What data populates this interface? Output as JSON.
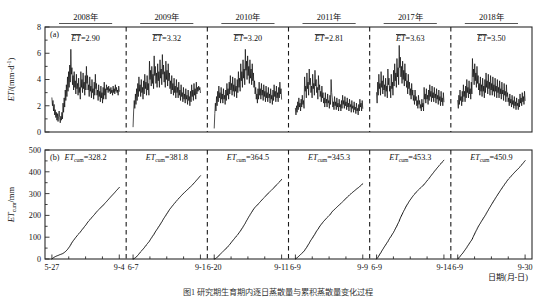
{
  "figure": {
    "caption": "图1  研究期生育期内逐日蒸散量与累积蒸散量变化过程",
    "xaxis_title": "日期(月-日)",
    "panel_a": {
      "id": "(a)",
      "ylabel_main": "ET",
      "ylabel_units": "/(mm·d",
      "ylabel_sup": "-1",
      "ylabel_tail": ")",
      "ylim": [
        0,
        8
      ],
      "yticks": [
        "0",
        "2",
        "4",
        "6",
        "8"
      ]
    },
    "panel_b": {
      "id": "(b)",
      "ylabel_main": "ET",
      "ylabel_sub": "cum",
      "ylabel_units": "/mm",
      "ylim": [
        0,
        500
      ],
      "yticks": [
        "0",
        "100",
        "200",
        "300",
        "400",
        "500"
      ]
    }
  },
  "chart_data": {
    "type": "line",
    "title": "图1  研究期生育期内逐日蒸散量与累积蒸散量变化过程",
    "xlabel": "日期(月-日)",
    "panels": [
      {
        "id": "(a)",
        "ylabel": "ET/(mm·d-1)",
        "ylim": [
          0,
          8
        ],
        "yticks": [
          0,
          2,
          4,
          6,
          8
        ],
        "series_name": "daily ET"
      },
      {
        "id": "(b)",
        "ylabel": "ETcum/mm",
        "ylim": [
          0,
          500
        ],
        "yticks": [
          0,
          100,
          200,
          300,
          400,
          500
        ],
        "series_name": "cumulative ET"
      }
    ],
    "segments": [
      {
        "year": "2008年",
        "et_mean_label": "ET=2.90",
        "et_mean": 2.9,
        "et_cum_label": "ETcum=328.2",
        "et_cum": 328.2,
        "x_start_label": "5-27",
        "x_end_label": "9-4",
        "daily_et": [
          2.6,
          2.0,
          2.4,
          1.6,
          2.1,
          1.3,
          1.7,
          1.1,
          1.5,
          0.9,
          1.4,
          0.8,
          1.2,
          1.6,
          1.1,
          0.7,
          1.2,
          0.9,
          1.5,
          1.0,
          2.2,
          1.5,
          2.6,
          1.9,
          3.2,
          2.4,
          3.6,
          2.7,
          4.2,
          3.1,
          4.6,
          3.4,
          5.1,
          3.8,
          6.3,
          4.4,
          4.9,
          3.6,
          4.3,
          3.2,
          4.6,
          3.4,
          3.9,
          2.9,
          4.4,
          3.3,
          3.7,
          2.8,
          4.1,
          3.0,
          3.4,
          2.5,
          4.6,
          3.4,
          4.0,
          3.0,
          4.5,
          3.3,
          3.8,
          2.8,
          4.3,
          3.2,
          5.0,
          3.7,
          4.3,
          3.2,
          3.6,
          2.7,
          4.2,
          3.1,
          3.5,
          2.6,
          4.0,
          3.0,
          3.3,
          2.5,
          3.8,
          2.8,
          4.4,
          3.3,
          3.7,
          2.8,
          3.2,
          2.4,
          3.6,
          2.7,
          3.1,
          2.3,
          3.5,
          2.6,
          3.0,
          2.2,
          3.4,
          2.5,
          3.8,
          2.8,
          3.3,
          2.5,
          3.6,
          3.2,
          3.4,
          3.0,
          3.5,
          3.1,
          3.3,
          2.9,
          3.4,
          3.0,
          3.2,
          2.8,
          3.5,
          3.0,
          3.3,
          2.9,
          3.6,
          3.1,
          3.4,
          3.0,
          3.2,
          2.8,
          3.5,
          3.1
        ]
      },
      {
        "year": "2009年",
        "et_mean_label": "ET=3.32",
        "et_mean": 3.32,
        "et_cum_label": "ETcum=381.8",
        "et_cum": 381.8,
        "x_start_label": "6-7",
        "x_end_label": "9-1",
        "daily_et": [
          0.4,
          1.6,
          2.4,
          1.8,
          2.9,
          2.1,
          3.3,
          2.4,
          3.7,
          2.7,
          4.2,
          3.1,
          3.6,
          2.7,
          4.0,
          3.0,
          3.4,
          2.5,
          3.9,
          2.9,
          4.4,
          3.3,
          3.8,
          2.8,
          4.3,
          3.2,
          3.7,
          2.8,
          5.4,
          4.0,
          4.7,
          3.5,
          5.0,
          3.7,
          4.4,
          3.3,
          5.8,
          4.3,
          5.0,
          3.7,
          4.5,
          3.4,
          5.2,
          3.9,
          4.6,
          3.4,
          5.5,
          4.1,
          4.8,
          3.6,
          5.9,
          4.4,
          5.1,
          3.8,
          4.6,
          3.4,
          5.4,
          4.0,
          4.7,
          3.5,
          5.2,
          3.9,
          4.5,
          3.3,
          3.9,
          2.9,
          4.3,
          3.2,
          3.7,
          2.8,
          4.1,
          3.0,
          3.5,
          2.6,
          4.0,
          3.0,
          3.4,
          2.6,
          3.8,
          2.8,
          3.2,
          2.4,
          3.6,
          2.7,
          3.0,
          2.3,
          3.4,
          2.5,
          2.9,
          2.2,
          3.3,
          2.5,
          2.8,
          2.1,
          3.2,
          2.4,
          2.7,
          2.0,
          3.1,
          2.3,
          3.6,
          2.7,
          3.2,
          2.4,
          3.7,
          2.8,
          3.3,
          2.5,
          3.8,
          2.9,
          3.4,
          3.1,
          3.5,
          3.2,
          3.4,
          3.0
        ]
      },
      {
        "year": "2010年",
        "et_mean_label": "ET=3.20",
        "et_mean": 3.2,
        "et_cum_label": "ETcum=364.5",
        "et_cum": 364.5,
        "x_start_label": "6-20",
        "x_end_label": "9-11",
        "daily_et": [
          0.3,
          1.4,
          2.2,
          1.6,
          2.7,
          2.0,
          3.1,
          2.3,
          3.5,
          2.6,
          3.0,
          2.2,
          3.4,
          2.5,
          2.9,
          2.2,
          3.3,
          2.5,
          2.8,
          2.1,
          3.2,
          2.4,
          3.7,
          2.8,
          3.3,
          2.5,
          3.8,
          2.9,
          4.3,
          3.2,
          3.7,
          2.8,
          4.2,
          3.1,
          3.6,
          2.7,
          4.1,
          3.1,
          3.5,
          2.6,
          4.0,
          3.0,
          4.6,
          3.4,
          4.1,
          3.1,
          5.2,
          3.9,
          4.6,
          3.4,
          5.5,
          4.1,
          4.8,
          3.6,
          6.3,
          4.7,
          5.4,
          4.0,
          5.8,
          4.3,
          5.0,
          3.7,
          5.5,
          4.1,
          4.8,
          3.6,
          5.2,
          3.9,
          4.5,
          3.4,
          3.9,
          2.9,
          3.4,
          2.5,
          2.9,
          2.2,
          3.3,
          2.5,
          3.8,
          2.8,
          3.3,
          2.5,
          3.7,
          2.8,
          3.2,
          2.4,
          3.6,
          2.7,
          3.1,
          2.3,
          3.5,
          2.6,
          3.0,
          2.3,
          3.4,
          2.6,
          2.9,
          2.2,
          3.3,
          2.5,
          2.8,
          2.1,
          3.2,
          2.4,
          3.6,
          2.7,
          3.1,
          2.3,
          3.5,
          2.6,
          3.0,
          2.3,
          3.4,
          2.6,
          3.8,
          2.9,
          3.3,
          2.5
        ]
      },
      {
        "year": "2011年",
        "et_mean_label": "ET=2.81",
        "et_mean": 2.81,
        "et_cum_label": "ETcum=345.3",
        "et_cum": 345.3,
        "x_start_label": "6-9",
        "x_end_label": "9-9",
        "daily_et": [
          1.8,
          1.3,
          2.0,
          1.5,
          2.3,
          1.7,
          2.6,
          1.9,
          2.2,
          1.6,
          2.5,
          1.9,
          2.8,
          2.1,
          2.4,
          1.8,
          4.2,
          3.1,
          3.5,
          2.6,
          4.5,
          3.3,
          3.8,
          2.8,
          4.8,
          3.6,
          4.1,
          3.0,
          3.5,
          2.6,
          4.4,
          3.3,
          3.7,
          2.8,
          4.7,
          3.5,
          4.0,
          3.0,
          3.4,
          2.5,
          4.3,
          3.2,
          3.6,
          2.7,
          3.1,
          2.3,
          3.5,
          2.6,
          3.0,
          2.2,
          2.6,
          1.9,
          3.0,
          2.2,
          2.5,
          1.9,
          2.9,
          2.2,
          2.4,
          1.8,
          2.8,
          2.1,
          4.0,
          3.0,
          2.6,
          1.9,
          2.3,
          1.7,
          2.7,
          2.0,
          2.3,
          1.7,
          2.6,
          1.9,
          2.2,
          1.6,
          2.5,
          1.9,
          2.1,
          1.6,
          2.4,
          1.8,
          2.8,
          2.1,
          2.4,
          1.8,
          2.7,
          2.0,
          2.3,
          1.7,
          2.6,
          1.9,
          2.2,
          1.6,
          2.5,
          1.9,
          2.1,
          1.5,
          2.4,
          1.8,
          2.0,
          1.5,
          2.3,
          1.7,
          1.9,
          1.4,
          2.2,
          1.6,
          1.8,
          1.3,
          2.1,
          1.6,
          2.5,
          1.9,
          2.2,
          1.6,
          2.4,
          1.8
        ]
      },
      {
        "year": "2017年",
        "et_mean_label": "ET=3.63",
        "et_mean": 3.63,
        "et_cum_label": "ETcum=453.3",
        "et_cum": 453.3,
        "x_start_label": "6-9",
        "x_end_label": "9-14",
        "daily_et": [
          3.0,
          2.2,
          3.8,
          2.8,
          4.4,
          3.3,
          3.7,
          2.8,
          4.6,
          3.4,
          3.9,
          2.9,
          4.3,
          3.2,
          3.6,
          2.7,
          4.1,
          3.1,
          3.5,
          2.6,
          4.8,
          3.6,
          4.1,
          3.1,
          3.5,
          2.6,
          4.4,
          3.3,
          3.8,
          2.8,
          4.7,
          3.5,
          5.2,
          3.9,
          4.5,
          3.4,
          5.6,
          4.2,
          4.9,
          3.6,
          6.6,
          4.9,
          5.7,
          4.2,
          5.0,
          3.7,
          5.4,
          4.0,
          4.7,
          3.5,
          5.2,
          3.9,
          4.5,
          3.4,
          3.9,
          2.9,
          4.4,
          3.3,
          3.8,
          2.8,
          3.3,
          2.5,
          3.7,
          2.8,
          3.2,
          2.4,
          2.8,
          2.1,
          3.2,
          2.4,
          2.7,
          2.0,
          2.4,
          1.8,
          2.8,
          2.1,
          2.4,
          1.8,
          2.1,
          1.6,
          2.5,
          1.9,
          2.2,
          1.6,
          3.4,
          2.5,
          2.9,
          2.2,
          3.3,
          2.5,
          2.8,
          2.1,
          3.2,
          2.4,
          3.6,
          2.7,
          3.1,
          2.3,
          3.5,
          2.6,
          3.0,
          2.3,
          3.4,
          2.6,
          2.9,
          2.2,
          3.3,
          2.5,
          2.8,
          2.1,
          3.2,
          2.4,
          2.7,
          2.0,
          3.1,
          2.3,
          2.6,
          2.0,
          3.0,
          2.3
        ]
      },
      {
        "year": "2018年",
        "et_mean_label": "ET=3.50",
        "et_mean": 3.5,
        "et_cum_label": "ETcum=450.9",
        "et_cum": 450.9,
        "x_start_label": "6-9",
        "x_end_label": "9-30",
        "daily_et": [
          2.4,
          1.8,
          2.8,
          2.1,
          3.2,
          2.4,
          2.7,
          2.0,
          3.1,
          2.3,
          3.6,
          2.7,
          3.1,
          2.3,
          3.5,
          2.6,
          4.0,
          3.0,
          3.4,
          2.6,
          3.9,
          2.9,
          3.3,
          2.5,
          3.8,
          2.9,
          5.6,
          4.2,
          4.8,
          3.6,
          5.2,
          3.9,
          4.5,
          3.4,
          5.0,
          3.7,
          4.3,
          3.2,
          3.7,
          2.8,
          4.2,
          3.1,
          3.6,
          2.7,
          4.1,
          3.1,
          3.5,
          2.6,
          4.0,
          3.0,
          4.5,
          3.4,
          3.9,
          2.9,
          4.4,
          3.3,
          3.8,
          2.8,
          4.3,
          3.2,
          3.7,
          2.8,
          4.2,
          3.1,
          3.6,
          2.7,
          4.1,
          3.1,
          3.5,
          2.6,
          4.0,
          3.0,
          3.4,
          2.6,
          3.9,
          2.9,
          3.3,
          2.5,
          3.8,
          2.9,
          3.2,
          2.4,
          3.7,
          2.8,
          3.1,
          2.3,
          3.6,
          2.7,
          3.0,
          2.3,
          2.6,
          2.0,
          2.9,
          2.2,
          2.5,
          1.9,
          2.8,
          2.1,
          2.4,
          1.8,
          2.7,
          2.0,
          2.3,
          1.7,
          2.6,
          2.0,
          2.2,
          1.7,
          2.5,
          1.9,
          2.9,
          2.2,
          2.6,
          2.0,
          3.0,
          2.3,
          2.7,
          2.1,
          3.1,
          2.4
        ]
      }
    ]
  }
}
